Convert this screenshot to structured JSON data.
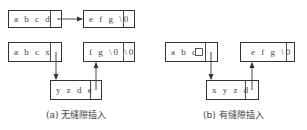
{
  "diagram": {
    "a": {
      "top_row": {
        "left_box": "a b c d",
        "right_box": "e f g \\0"
      },
      "bottom_row": {
        "left_box": "a b c x",
        "right_box": "f g \\0 \\0",
        "inserted_box": "y z d e"
      },
      "caption": "(a) 无缝隙插入"
    },
    "b": {
      "left_box": "a b c",
      "right_box": "e f g \\0",
      "inserted_box": "x y z d",
      "caption": "(b) 有缝隙插入"
    }
  }
}
